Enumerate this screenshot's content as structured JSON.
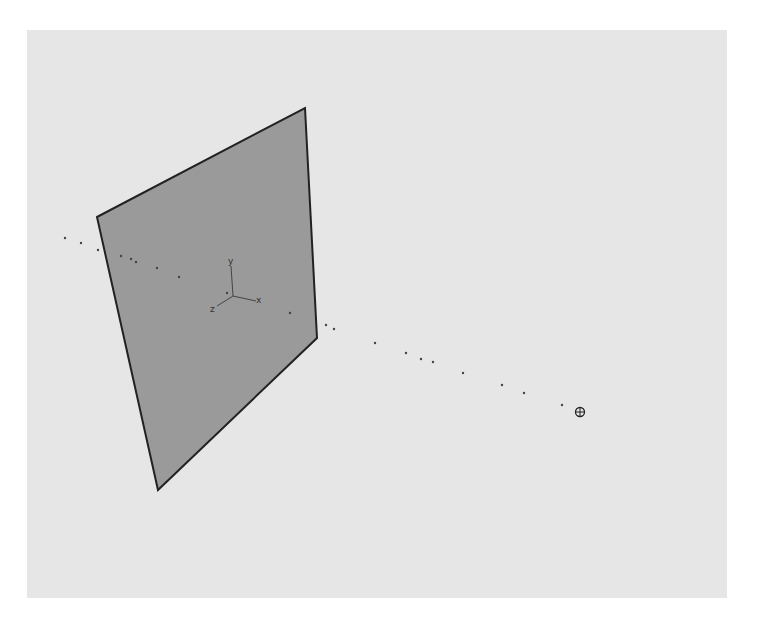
{
  "viewport": {
    "background": "#e6e6e6",
    "page_background": "#ffffff"
  },
  "plane": {
    "fill": "#9a9a9a",
    "edge_color": "#222222",
    "corners": [
      [
        97,
        217
      ],
      [
        305,
        108
      ],
      [
        317,
        338
      ],
      [
        158,
        490
      ]
    ]
  },
  "axis_gizmo": {
    "origin": [
      233,
      296
    ],
    "labels": {
      "x": "x",
      "y": "y",
      "z": "z"
    },
    "color": "#444444"
  },
  "path_points": [
    [
      65,
      238
    ],
    [
      81,
      243
    ],
    [
      98,
      250
    ],
    [
      121,
      256
    ],
    [
      131,
      259
    ],
    [
      136,
      262
    ],
    [
      157,
      268
    ],
    [
      179,
      277
    ],
    [
      227,
      293
    ],
    [
      290,
      313
    ],
    [
      326,
      325
    ],
    [
      334,
      329
    ],
    [
      375,
      343
    ],
    [
      406,
      353
    ],
    [
      421,
      359
    ],
    [
      433,
      362
    ],
    [
      463,
      373
    ],
    [
      502,
      385
    ],
    [
      524,
      393
    ],
    [
      562,
      405
    ]
  ],
  "target_marker": {
    "position": [
      580,
      412
    ],
    "icon": "crosshair-circle-icon"
  }
}
